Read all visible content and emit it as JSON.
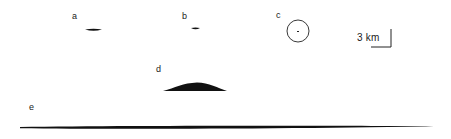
{
  "diagram": {
    "panels": [
      {
        "id": "a",
        "label": "a",
        "shape": "thin-lens"
      },
      {
        "id": "b",
        "label": "b",
        "shape": "small-lens"
      },
      {
        "id": "c",
        "label": "c",
        "shape": "circle"
      },
      {
        "id": "d",
        "label": "d",
        "shape": "dome"
      },
      {
        "id": "e",
        "label": "e",
        "shape": "long-thin-lens"
      }
    ],
    "scale_bar": {
      "label": "3 km",
      "length_km": 3
    },
    "colors": {
      "ink": "#111111",
      "background": "#ffffff"
    }
  }
}
